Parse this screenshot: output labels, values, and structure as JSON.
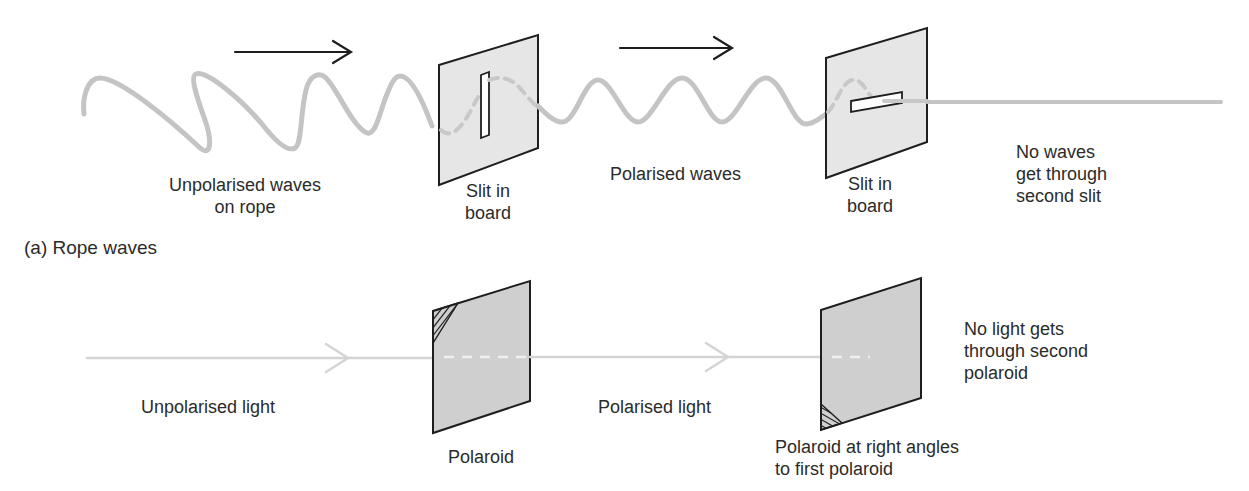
{
  "figure": {
    "rope_section": {
      "caption": "(a) Rope waves",
      "labels": {
        "unpolarised_waves": [
          "Unpolarised waves",
          "on rope"
        ],
        "slit_1": [
          "Slit in",
          "board"
        ],
        "polarised_waves": [
          "Polarised waves"
        ],
        "slit_2": [
          "Slit in",
          "board"
        ],
        "no_waves": [
          "No waves",
          "get through",
          "second slit"
        ]
      },
      "arrows": [
        "direction-arrow-1",
        "direction-arrow-2"
      ]
    },
    "light_section": {
      "labels": {
        "unpolarised_light": [
          "Unpolarised light"
        ],
        "polaroid_1": [
          "Polaroid"
        ],
        "polarised_light": [
          "Polarised light"
        ],
        "polaroid_2": [
          "Polaroid at right angles",
          "to first polaroid"
        ],
        "no_light": [
          "No light gets",
          "through second",
          "polaroid"
        ]
      }
    },
    "colors": {
      "rope": "#c4c4c4",
      "light_beam": "#d4d4d4",
      "board_fill": "#e6e6e6",
      "polaroid_fill": "#cfcfcf",
      "outline": "#1e1e1e",
      "text": "#2b2b2b"
    }
  }
}
